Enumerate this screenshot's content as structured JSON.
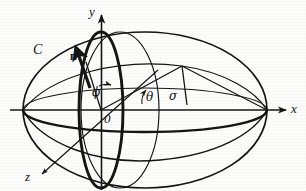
{
  "figure": {
    "caption": "",
    "background_color": "#fdfdfc",
    "ink_color": "#141414"
  },
  "axes": {
    "x_label": "x",
    "y_label": "y",
    "z_label": "z",
    "origin_label": "0"
  },
  "labels": {
    "curve": "C",
    "normal_vector": "n",
    "angle_phi": "ϕ",
    "angle_theta": "θ",
    "angle_sigma": "σ"
  },
  "geometry": {
    "origin": {
      "x": 101,
      "y": 110
    },
    "ellipsoid_outline": {
      "cx": 145,
      "cy": 110,
      "rx": 122,
      "ry": 78
    },
    "equator_ellipse": {
      "cx": 145,
      "cy": 110,
      "rx": 122,
      "ry": 22
    },
    "meridian_bold": {
      "cx": 101,
      "cy": 110,
      "rx": 22,
      "ry": 78
    },
    "meridian_thin": {
      "cx": 118,
      "cy": 110,
      "rx": 40,
      "ry": 78
    },
    "x_axis": {
      "x1": 10,
      "y1": 110,
      "x2": 288,
      "y2": 110
    },
    "y_axis": {
      "x1": 101,
      "y1": 188,
      "x2": 101,
      "y2": 12
    },
    "z_axis": {
      "x1": 156,
      "y1": 72,
      "x2": 40,
      "y2": 176
    },
    "normal_arrow": {
      "x1": 86,
      "y1": 82,
      "x2": 75,
      "y2": 46
    },
    "radius_line": {
      "x1": 101,
      "y1": 110,
      "x2": 182,
      "y2": 66
    },
    "sigma_drop": {
      "x1": 182,
      "y1": 66,
      "x2": 186,
      "y2": 104
    }
  },
  "colors": {
    "ink": "#141414",
    "paper": "#fdfdfc",
    "thin_line": "#2a2a2a"
  }
}
